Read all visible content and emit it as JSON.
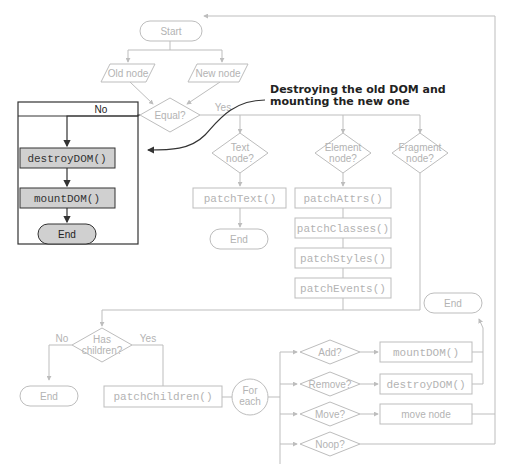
{
  "diagram": {
    "type": "flowchart",
    "nodes": {
      "start": "Start",
      "old_node": "Old node",
      "new_node": "New node",
      "equal": "Equal?",
      "equal_yes": "Yes",
      "equal_no": "No",
      "destroy_dom": "destroyDOM()",
      "mount_dom": "mountDOM()",
      "end_left": "End",
      "text_node_l1": "Text",
      "text_node_l2": "node?",
      "element_node_l1": "Element",
      "element_node_l2": "node?",
      "fragment_node_l1": "Fragment",
      "fragment_node_l2": "node?",
      "patch_text": "patchText()",
      "end_text": "End",
      "patch_attrs": "patchAttrs()",
      "patch_classes": "patchClasses()",
      "patch_styles": "patchStyles()",
      "patch_events": "patchEvents()",
      "has_children_l1": "Has",
      "has_children_l2": "children?",
      "has_children_no": "No",
      "has_children_yes": "Yes",
      "end_children": "End",
      "patch_children": "patchChildren()",
      "for_each_l1": "For",
      "for_each_l2": "each",
      "add": "Add?",
      "remove": "Remove?",
      "move": "Move?",
      "noop": "Noop?",
      "mount_dom_child": "mountDOM()",
      "destroy_dom_child": "destroyDOM()",
      "move_node": "move node",
      "end_right": "End"
    },
    "annotation": {
      "line1": "Destroying the old DOM and",
      "line2": "mounting the new one"
    }
  }
}
